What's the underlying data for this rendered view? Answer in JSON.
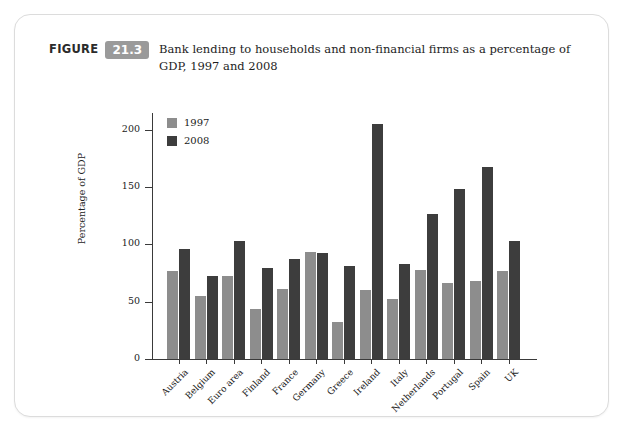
{
  "figure": {
    "label_word": "FIGURE",
    "number": "21.3",
    "caption": "Bank lending to households and non-financial firms as a percentage of GDP, 1997 and 2008",
    "badge_color": "#9a9a9a"
  },
  "legend": {
    "position": "top-left-inside",
    "entries": [
      {
        "label": "1997",
        "color": "#8d8d8d"
      },
      {
        "label": "2008",
        "color": "#3d3d3d"
      }
    ]
  },
  "chart_data": {
    "type": "bar",
    "title": "Bank lending to households and non-financial firms as a percentage of GDP, 1997 and 2008",
    "xlabel": "",
    "ylabel": "Percentage of GDP",
    "ylim": [
      0,
      207.5
    ],
    "yticks": [
      0,
      50,
      100,
      150,
      200
    ],
    "ytick_labels": [
      "0",
      "50",
      "100",
      "150",
      "200"
    ],
    "grid": false,
    "categories": [
      "Austria",
      "Belgium",
      "Euro area",
      "Finland",
      "France",
      "Germany",
      "Greece",
      "Ireland",
      "Italy",
      "Netherlands",
      "Portugal",
      "Spain",
      "UK"
    ],
    "series": [
      {
        "name": "1997",
        "color": "#8d8d8d",
        "values": [
          77,
          55,
          72,
          44,
          61,
          93,
          32,
          60,
          52,
          78,
          66,
          68,
          77
        ]
      },
      {
        "name": "2008",
        "color": "#3d3d3d",
        "values": [
          96,
          72,
          103,
          79,
          87,
          92,
          81,
          205,
          83,
          126,
          148,
          167,
          103
        ]
      }
    ]
  }
}
